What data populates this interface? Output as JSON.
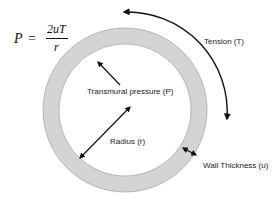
{
  "diagram": {
    "formula": {
      "lhs": "P",
      "equals": "=",
      "numerator": "2uT",
      "denominator": "r"
    },
    "labels": {
      "tension": "Tension (T)",
      "transmural_pressure": "Transmural pressure (P)",
      "radius": "Radius (r)",
      "wall_thickness": "Wall Thickness (u)"
    },
    "ring": {
      "center": [
        125,
        110
      ],
      "outer_radius": 82,
      "inner_radius": 66,
      "fill_color": "#d4d4d4",
      "edge_color": "#a8a8a8"
    },
    "colors": {
      "arrow": "#111111",
      "background": "#ffffff",
      "text": "#1a1a1a"
    }
  }
}
